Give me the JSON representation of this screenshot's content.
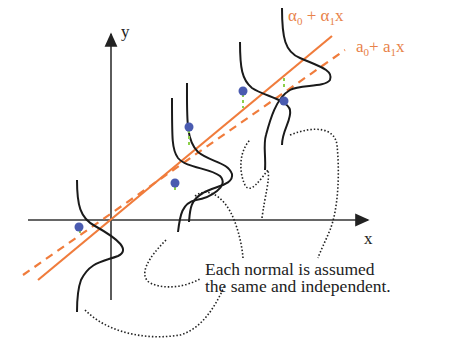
{
  "diagram": {
    "axes": {
      "x_label": "x",
      "y_label": "y"
    },
    "lines": {
      "true_line": {
        "label_parts": [
          "α",
          "0",
          " + ",
          "α",
          "1",
          "x"
        ],
        "style": "solid",
        "color": "#f07c3c"
      },
      "estimated_line": {
        "label_parts": [
          "a",
          "0",
          "+ ",
          "a",
          "1",
          "x"
        ],
        "style": "dashed",
        "color": "#f07c3c"
      }
    },
    "points": {
      "color": "#4a5bb0",
      "residual_color": "#8ccf4a",
      "count": 5
    },
    "normal_curves": {
      "count": 4,
      "color": "#1a1a1a"
    },
    "caption": {
      "line1": "Each normal is assumed",
      "line2": "the same and independent."
    }
  }
}
